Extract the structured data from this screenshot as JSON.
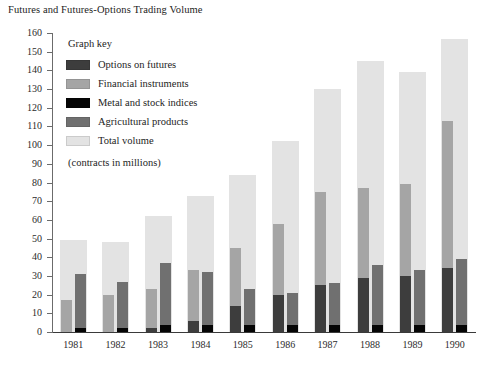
{
  "chart_data": {
    "type": "bar",
    "title": "Futures and Futures-Options Trading Volume",
    "subtitle": "(contracts in millions)",
    "xlabel": "",
    "ylabel": "",
    "ylim": [
      0,
      160
    ],
    "ytick_step": 10,
    "yticks": [
      0,
      10,
      20,
      30,
      40,
      50,
      60,
      70,
      80,
      90,
      100,
      110,
      120,
      130,
      140,
      150,
      160
    ],
    "grid": false,
    "legend_position": "inside-top-left",
    "legend_title": "Graph key",
    "categories": [
      "1981",
      "1982",
      "1983",
      "1984",
      "1985",
      "1986",
      "1987",
      "1988",
      "1989",
      "1990"
    ],
    "series": [
      {
        "name": "Options on futures",
        "color": "#3d3d3d",
        "values": [
          0,
          0,
          2,
          6,
          14,
          20,
          25,
          29,
          30,
          34
        ]
      },
      {
        "name": "Financial instruments",
        "color": "#a5a5a5",
        "values": [
          17,
          20,
          23,
          33,
          45,
          58,
          75,
          77,
          79,
          113
        ]
      },
      {
        "name": "Metal and stock indices",
        "color": "#050505",
        "values": [
          2,
          2,
          4,
          4,
          4,
          4,
          4,
          4,
          4,
          4
        ]
      },
      {
        "name": "Agricultural products",
        "color": "#707070",
        "values": [
          31,
          27,
          37,
          32,
          23,
          21,
          26,
          36,
          33,
          39
        ]
      },
      {
        "name": "Total volume",
        "color": "#e3e3e3",
        "values": [
          49,
          48,
          62,
          73,
          84,
          102,
          130,
          145,
          139,
          157
        ]
      }
    ],
    "legend": [
      {
        "label": "Options on futures",
        "color": "#3d3d3d"
      },
      {
        "label": "Financial instruments",
        "color": "#a5a5a5"
      },
      {
        "label": "Metal and stock indices",
        "color": "#050505"
      },
      {
        "label": "Agricultural products",
        "color": "#707070"
      },
      {
        "label": "Total volume",
        "color": "#e3e3e3"
      }
    ]
  }
}
